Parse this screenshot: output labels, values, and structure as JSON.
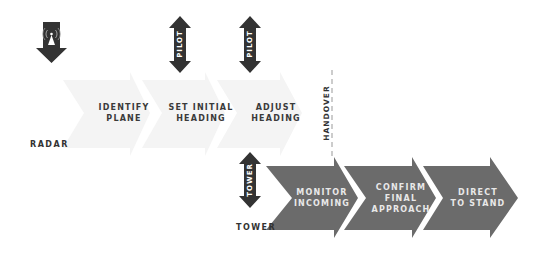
{
  "lanes": {
    "radar": "RADAR",
    "tower": "TOWER",
    "handover": "HANDOVER"
  },
  "actors": {
    "radar_icon": "radar-tower-icon",
    "pilot_1": "PILOT",
    "pilot_2": "PILOT",
    "tower": "TOWER"
  },
  "radar_steps": [
    {
      "line1": "IDENTIFY",
      "line2": "PLANE"
    },
    {
      "line1": "SET INITIAL",
      "line2": "HEADING"
    },
    {
      "line1": "ADJUST",
      "line2": "HEADING"
    }
  ],
  "tower_steps": [
    {
      "line1": "MONITOR",
      "line2": "INCOMING"
    },
    {
      "line1": "CONFIRM",
      "line2": "FINAL",
      "line3": "APPROACH"
    },
    {
      "line1": "DIRECT",
      "line2": "TO STAND"
    }
  ],
  "colors": {
    "light_chevron": "#f3f3f3",
    "dark_chevron": "#6b6b6b",
    "arrow_dark": "#333333"
  }
}
